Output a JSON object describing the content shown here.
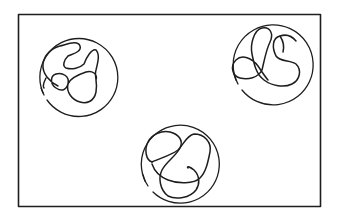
{
  "diagram": {
    "colors": {
      "background": "#ffffff",
      "ink": "#1e1e1e"
    },
    "frame": {
      "x": 18,
      "y": 14,
      "width": 303,
      "height": 193
    },
    "spheres": [
      {
        "id": "left",
        "cx": 74,
        "cy": 72,
        "r": 39
      },
      {
        "id": "right",
        "cx": 269,
        "cy": 60,
        "r": 40
      },
      {
        "id": "bottom",
        "cx": 179,
        "cy": 162,
        "r": 39
      }
    ],
    "labels": []
  }
}
